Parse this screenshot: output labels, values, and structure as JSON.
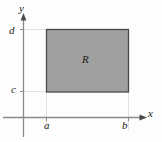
{
  "figure": {
    "background_color": "#fdfdfd"
  },
  "axes": {
    "x_axis_label": "x",
    "y_axis_label": "y",
    "axis_color": "#8a8a8a",
    "origin": {
      "x": 23,
      "y": 117
    }
  },
  "ticks": {
    "x": [
      {
        "label": "a",
        "position": 46
      },
      {
        "label": "b",
        "position": 128
      }
    ],
    "y": [
      {
        "label": "c",
        "position": 92
      },
      {
        "label": "d",
        "position": 29
      }
    ]
  },
  "region": {
    "label": "R",
    "fill_color": "#a0a0a0",
    "stroke_color": "#4a4a4a",
    "left": 46,
    "right": 128,
    "top": 29,
    "bottom": 92
  },
  "guide_lines": {
    "color": "#e2e2e2",
    "description": "faint guides from tick marks to rectangle corners"
  },
  "icons": {
    "x_arrow": "arrow-right-icon",
    "y_arrow": "arrow-up-icon"
  }
}
